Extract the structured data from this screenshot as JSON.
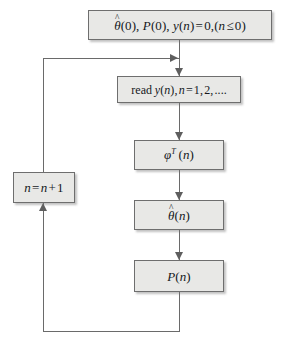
{
  "diagram": {
    "type": "flowchart",
    "background_color": "#ffffff",
    "node_fill_color": "#e8e8e6",
    "node_border_color": "#6e6e6e",
    "edge_color": "#6a6a6a",
    "nodes": [
      {
        "id": "init",
        "name": "initialization-box",
        "text": "θ̂(0), P(0), y(n)=0,(n≤0)",
        "parts": {
          "theta_hat": "θ",
          "hat": "ˆ",
          "after_theta": "(0), ",
          "p_symbol": "P",
          "p_arg": "(0), ",
          "y_symbol": "y",
          "y_rest": "(n)=0,(n≤0)"
        }
      },
      {
        "id": "read",
        "name": "read-data-box",
        "text": "read y(n), n=1,2,....",
        "parts": {
          "keyword": "read ",
          "y_symbol": "y",
          "y_arg": "(n), ",
          "n_symbol": "n",
          "n_rest": "=1,2,...."
        }
      },
      {
        "id": "phi",
        "name": "regressor-vector-box",
        "text": "φᵀ(n)",
        "parts": {
          "phi": "φ",
          "superscript": "T",
          "arg": "(n)"
        }
      },
      {
        "id": "theta",
        "name": "parameter-estimate-box",
        "text": "θ̂(n)",
        "parts": {
          "theta": "θ",
          "hat": "ˆ",
          "arg": "(n)"
        }
      },
      {
        "id": "p",
        "name": "covariance-matrix-box",
        "text": "P(n)",
        "parts": {
          "p": "P",
          "arg": "(n)"
        }
      },
      {
        "id": "increment",
        "name": "increment-counter-box",
        "text": "n=n+1",
        "parts": {
          "n1": "n",
          "eq": "=",
          "n2": "n",
          "plus_one": "+1"
        }
      }
    ],
    "edges": [
      {
        "name": "edge-init-to-read",
        "from": "init",
        "to": "read",
        "direction": "down"
      },
      {
        "name": "edge-read-to-phi",
        "from": "read",
        "to": "phi",
        "direction": "down"
      },
      {
        "name": "edge-phi-to-theta",
        "from": "phi",
        "to": "theta",
        "direction": "down"
      },
      {
        "name": "edge-theta-to-p",
        "from": "theta",
        "to": "p",
        "direction": "down"
      },
      {
        "name": "edge-p-to-increment",
        "from": "p",
        "to": "increment",
        "direction": "feedback-up-left"
      },
      {
        "name": "edge-increment-to-read",
        "from": "increment",
        "to": "read",
        "direction": "feedback-up-right"
      }
    ]
  }
}
